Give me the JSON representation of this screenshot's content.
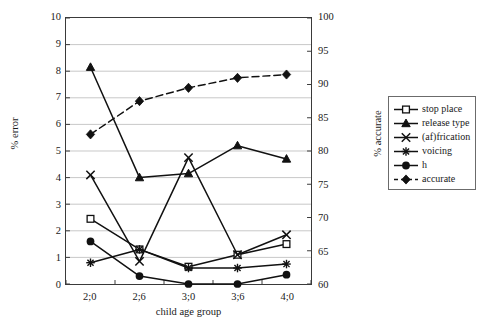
{
  "chart_data": {
    "type": "line",
    "title": "",
    "subtitle": "",
    "xlabel": "child age group",
    "ylabel": "% error",
    "ylabel_secondary": "% accurate",
    "categories": [
      "2;0",
      "2;6",
      "3;0",
      "3;6",
      "4;0"
    ],
    "ylim": [
      0,
      10
    ],
    "yticks": [
      0,
      1,
      2,
      3,
      4,
      5,
      6,
      7,
      8,
      9,
      10
    ],
    "ylim_secondary": [
      60,
      100
    ],
    "yticks_secondary": [
      60,
      65,
      70,
      75,
      80,
      85,
      90,
      95,
      100
    ],
    "grid": true,
    "grid_axis": "y",
    "legend_position": "right-outside",
    "series": [
      {
        "name": "stop place",
        "axis": "left",
        "marker": "open-square",
        "line": "solid",
        "values": [
          2.45,
          1.3,
          0.65,
          1.1,
          1.5
        ]
      },
      {
        "name": "release type",
        "axis": "left",
        "marker": "filled-triangle",
        "line": "solid",
        "values": [
          8.15,
          4.0,
          4.15,
          5.2,
          4.7
        ]
      },
      {
        "name": "(af)frication",
        "axis": "left",
        "marker": "x-cross",
        "line": "solid",
        "values": [
          4.1,
          0.85,
          4.75,
          1.1,
          1.85
        ]
      },
      {
        "name": "voicing",
        "axis": "left",
        "marker": "asterisk",
        "line": "solid",
        "values": [
          0.8,
          1.3,
          0.6,
          0.6,
          0.75
        ]
      },
      {
        "name": "h",
        "axis": "left",
        "marker": "filled-circle",
        "line": "solid",
        "values": [
          1.6,
          0.3,
          0.0,
          0.0,
          0.35
        ]
      },
      {
        "name": "accurate",
        "axis": "right",
        "marker": "filled-diamond",
        "line": "dashed",
        "values": [
          82.5,
          87.5,
          89.5,
          91.0,
          91.5
        ]
      }
    ]
  },
  "axes": {
    "left_title": "% error",
    "right_title": "% accurate",
    "x_title": "child age group",
    "left_ticks": [
      "0",
      "1",
      "2",
      "3",
      "4",
      "5",
      "6",
      "7",
      "8",
      "9",
      "10"
    ],
    "right_ticks": [
      "60",
      "65",
      "70",
      "75",
      "80",
      "85",
      "90",
      "95",
      "100"
    ],
    "x_ticks": [
      "2;0",
      "2;6",
      "3;0",
      "3;6",
      "4;0"
    ]
  },
  "legend": {
    "items": [
      {
        "label": "stop place",
        "marker": "open-square-marker"
      },
      {
        "label": "release type",
        "marker": "filled-triangle-marker"
      },
      {
        "label": "(af)frication",
        "marker": "x-cross-marker"
      },
      {
        "label": "voicing",
        "marker": "asterisk-marker"
      },
      {
        "label": "h",
        "marker": "filled-circle-marker"
      },
      {
        "label": "accurate",
        "marker": "filled-diamond-marker"
      }
    ]
  },
  "colors": {
    "ink": "#111111",
    "grid": "#b9b9b9",
    "frame": "#3a3a3a",
    "background": "#ffffff"
  }
}
